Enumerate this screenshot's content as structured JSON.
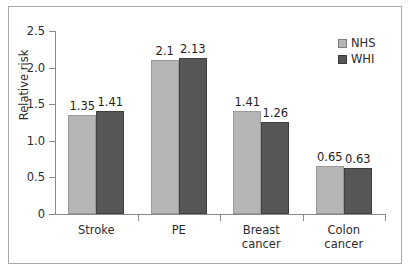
{
  "chart_data": {
    "type": "bar",
    "title": "",
    "subtitle": "",
    "xlabel": "",
    "ylabel": "Relative risk",
    "ylim": [
      0,
      2.5
    ],
    "yticks": [
      "0",
      "0.5",
      "1.0",
      "1.5",
      "2.0",
      "2.5"
    ],
    "ytick_values": [
      0,
      0.5,
      1.0,
      1.5,
      2.0,
      2.5
    ],
    "grid": false,
    "legend_position": "top-right",
    "categories": [
      "Stroke",
      "PE",
      "Breast cancer",
      "Colon cancer"
    ],
    "category_lines": [
      [
        "Stroke"
      ],
      [
        "PE"
      ],
      [
        "Breast",
        "cancer"
      ],
      [
        "Colon",
        "cancer"
      ]
    ],
    "series": [
      {
        "name": "NHS",
        "color": "#b6b6b6",
        "values": [
          1.35,
          2.1,
          1.41,
          0.65
        ],
        "labels": [
          "1.35",
          "2.1",
          "1.41",
          "0.65"
        ]
      },
      {
        "name": "WHI",
        "color": "#565656",
        "values": [
          1.41,
          2.13,
          1.26,
          0.63
        ],
        "labels": [
          "1.41",
          "2.13",
          "1.26",
          "0.63"
        ]
      }
    ]
  }
}
